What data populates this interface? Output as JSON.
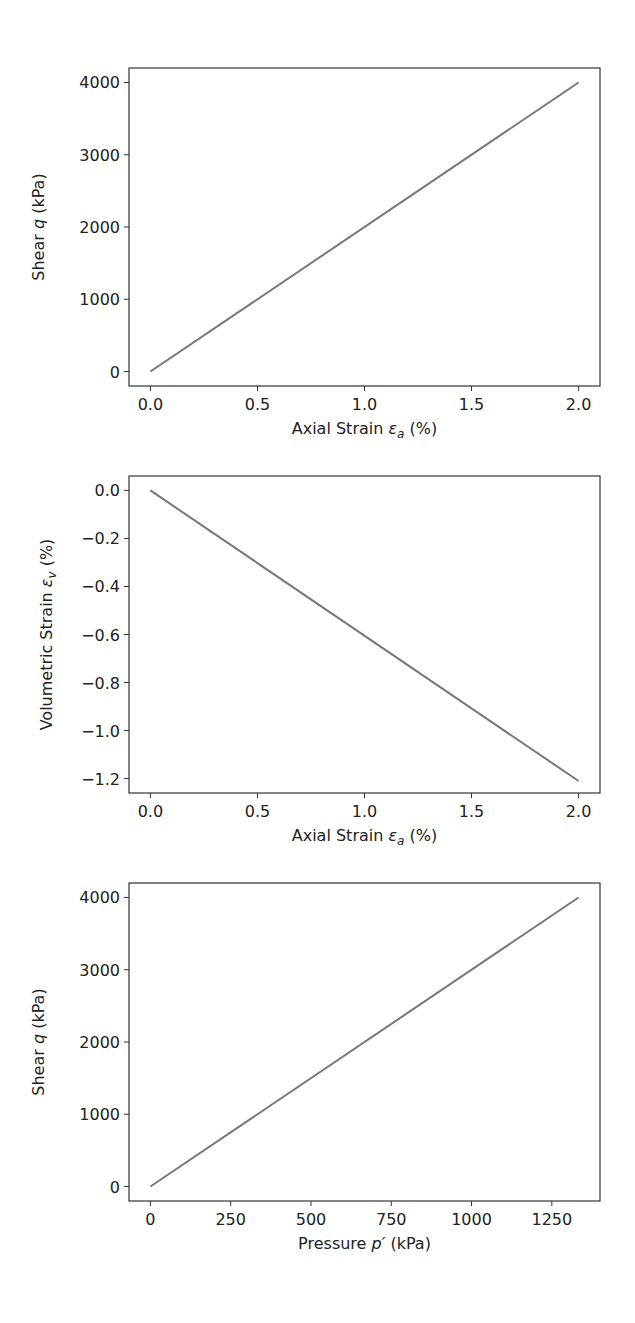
{
  "chart_data": [
    {
      "type": "line",
      "title": "",
      "xlabel": "Axial Strain ε_a (%)",
      "xlabel_parts": [
        "Axial Strain ",
        "ε",
        "a",
        " (%)"
      ],
      "ylabel": "Shear q (kPa)",
      "ylabel_parts": [
        "Shear ",
        "q",
        "",
        " (kPa)"
      ],
      "xlim": [
        -0.1,
        2.1
      ],
      "ylim": [
        -200,
        4200
      ],
      "xticks": [
        0.0,
        0.5,
        1.0,
        1.5,
        2.0
      ],
      "xtick_labels": [
        "0.0",
        "0.5",
        "1.0",
        "1.5",
        "2.0"
      ],
      "yticks": [
        0,
        1000,
        2000,
        3000,
        4000
      ],
      "ytick_labels": [
        "0",
        "1000",
        "2000",
        "3000",
        "4000"
      ],
      "grid": false,
      "series": [
        {
          "name": "q vs ε_a",
          "color": "#777777",
          "x": [
            0.0,
            2.0
          ],
          "y": [
            0,
            4000
          ]
        }
      ]
    },
    {
      "type": "line",
      "title": "",
      "xlabel": "Axial Strain ε_a (%)",
      "xlabel_parts": [
        "Axial Strain ",
        "ε",
        "a",
        " (%)"
      ],
      "ylabel": "Volumetric Strain ε_v (%)",
      "ylabel_parts": [
        "Volumetric Strain ",
        "ε",
        "v",
        " (%)"
      ],
      "xlim": [
        -0.1,
        2.1
      ],
      "ylim": [
        -1.26,
        0.06
      ],
      "xticks": [
        0.0,
        0.5,
        1.0,
        1.5,
        2.0
      ],
      "xtick_labels": [
        "0.0",
        "0.5",
        "1.0",
        "1.5",
        "2.0"
      ],
      "yticks": [
        0.0,
        -0.2,
        -0.4,
        -0.6,
        -0.8,
        -1.0,
        -1.2
      ],
      "ytick_labels": [
        "0.0",
        "−0.2",
        "−0.4",
        "−0.6",
        "−0.8",
        "−1.0",
        "−1.2"
      ],
      "grid": false,
      "series": [
        {
          "name": "ε_v vs ε_a",
          "color": "#777777",
          "x": [
            0.0,
            2.0
          ],
          "y": [
            0.0,
            -1.21
          ]
        }
      ]
    },
    {
      "type": "line",
      "title": "",
      "xlabel": "Pressure p′ (kPa)",
      "xlabel_parts": [
        "Pressure ",
        "p′",
        "",
        " (kPa)"
      ],
      "ylabel": "Shear q (kPa)",
      "ylabel_parts": [
        "Shear ",
        "q",
        "",
        " (kPa)"
      ],
      "xlim": [
        -66.7,
        1400
      ],
      "ylim": [
        -200,
        4200
      ],
      "xticks": [
        0,
        250,
        500,
        750,
        1000,
        1250
      ],
      "xtick_labels": [
        "0",
        "250",
        "500",
        "750",
        "1000",
        "1250"
      ],
      "yticks": [
        0,
        1000,
        2000,
        3000,
        4000
      ],
      "ytick_labels": [
        "0",
        "1000",
        "2000",
        "3000",
        "4000"
      ],
      "grid": false,
      "series": [
        {
          "name": "q vs p′",
          "color": "#777777",
          "x": [
            0,
            1333.3
          ],
          "y": [
            0,
            4000
          ]
        }
      ]
    }
  ],
  "layout": {
    "panels": [
      {
        "left": 129,
        "top": 68,
        "right": 600,
        "bottom": 386
      },
      {
        "left": 129,
        "top": 476,
        "right": 600,
        "bottom": 793
      },
      {
        "left": 129,
        "top": 883,
        "right": 600,
        "bottom": 1201
      }
    ]
  }
}
